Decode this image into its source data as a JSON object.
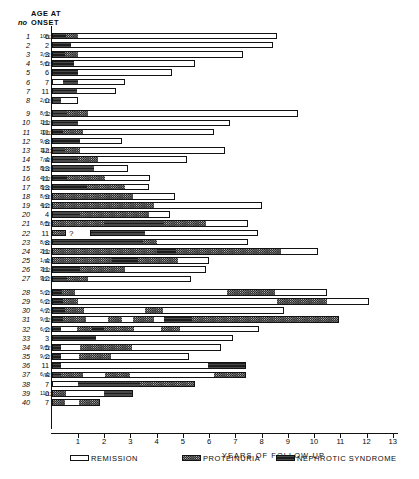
{
  "header": {
    "no_label": "no",
    "age_line1": "AGE AT",
    "age_line2": "ONSET"
  },
  "axis": {
    "title": "YEARS OF FOLLOW-UP",
    "ticks": [
      "1",
      "2",
      "3",
      "4",
      "5",
      "6",
      "7",
      "8",
      "9",
      "10",
      "11",
      "12",
      "13"
    ],
    "min": 0,
    "max": 13.2
  },
  "legend": [
    {
      "key": "remission",
      "label": "REMISSION",
      "swatch": "white"
    },
    {
      "key": "proteinuria",
      "label": "PROTEINURIA",
      "swatch": "checker"
    },
    {
      "key": "nephrotic",
      "label": "NEPHROTIC SYNDROME",
      "swatch": "dark"
    }
  ],
  "colors": {
    "remission": "#ffffff",
    "proteinuria": "#d8d8d8",
    "nephrotic": "#2e2e2e",
    "ink": "#121212"
  },
  "chart_data": {
    "type": "bar",
    "title": "",
    "xlabel": "YEARS OF FOLLOW-UP",
    "ylabel": "",
    "xlim": [
      0,
      13.2
    ],
    "grid": false,
    "legend_position": "bottom",
    "note": "Stacked horizontal timeline bars; each patient row is a sequence of disease-state segments measured in years of follow-up.",
    "categories": [
      "remission",
      "proteinuria",
      "nephrotic"
    ],
    "rows": [
      {
        "no": "1",
        "age": "6",
        "frac": "10/12",
        "segs": [
          [
            "nephrotic",
            0.55
          ],
          [
            "proteinuria",
            0.45
          ],
          [
            "remission",
            7.6
          ]
        ]
      },
      {
        "no": "2",
        "age": "2",
        "frac": "",
        "segs": [
          [
            "nephrotic",
            0.75
          ],
          [
            "remission",
            7.7
          ]
        ]
      },
      {
        "no": "3",
        "age": "3",
        "frac": "3/12",
        "segs": [
          [
            "nephrotic",
            0.5
          ],
          [
            "proteinuria",
            0.5
          ],
          [
            "remission",
            6.3
          ]
        ]
      },
      {
        "no": "4",
        "age": "6",
        "frac": "5/12",
        "segs": [
          [
            "nephrotic",
            0.85
          ],
          [
            "remission",
            4.6
          ]
        ]
      },
      {
        "no": "5",
        "age": "6",
        "frac": "",
        "segs": [
          [
            "nephrotic",
            1.0
          ],
          [
            "remission",
            3.6
          ]
        ]
      },
      {
        "no": "6",
        "age": "7",
        "frac": "",
        "segs": [
          [
            "remission",
            0.45
          ],
          [
            "nephrotic",
            0.55
          ],
          [
            "remission",
            1.8
          ]
        ]
      },
      {
        "no": "7",
        "age": "11",
        "frac": "",
        "segs": [
          [
            "nephrotic",
            0.95
          ],
          [
            "remission",
            1.5
          ]
        ]
      },
      {
        "no": "8",
        "age": "0",
        "frac": "2/12",
        "segs": [
          [
            "nephrotic",
            0.35
          ],
          [
            "remission",
            0.65
          ]
        ]
      },
      {
        "no": "9",
        "age": "1",
        "frac": "8/12",
        "segs": [
          [
            "nephrotic",
            0.6
          ],
          [
            "proteinuria",
            0.8
          ],
          [
            "remission",
            8.0
          ]
        ]
      },
      {
        "no": "10",
        "age": "11",
        "frac": "1/12",
        "segs": [
          [
            "nephrotic",
            1.0
          ],
          [
            "remission",
            5.8
          ]
        ]
      },
      {
        "no": "11",
        "age": "11",
        "frac": "10/12",
        "segs": [
          [
            "nephrotic",
            0.45
          ],
          [
            "proteinuria",
            0.75
          ],
          [
            "remission",
            5.0
          ]
        ]
      },
      {
        "no": "12",
        "age": "8",
        "frac": "9/12",
        "segs": [
          [
            "nephrotic",
            1.1
          ],
          [
            "remission",
            1.6
          ]
        ]
      },
      {
        "no": "13",
        "age": "12",
        "frac": "11/12",
        "segs": [
          [
            "nephrotic",
            0.5
          ],
          [
            "proteinuria",
            0.6
          ],
          [
            "remission",
            5.5
          ]
        ]
      },
      {
        "no": "14",
        "age": "4",
        "frac": "7/12",
        "segs": [
          [
            "nephrotic",
            1.0
          ],
          [
            "proteinuria",
            0.75
          ],
          [
            "remission",
            3.4
          ]
        ]
      },
      {
        "no": "15",
        "age": "13",
        "frac": "8/12",
        "segs": [
          [
            "nephrotic",
            1.6
          ],
          [
            "remission",
            1.3
          ]
        ]
      },
      {
        "no": "16",
        "age": "11",
        "frac": "4/12",
        "segs": [
          [
            "nephrotic",
            0.6
          ],
          [
            "proteinuria",
            1.45
          ],
          [
            "remission",
            1.7
          ]
        ]
      },
      {
        "no": "17",
        "age": "13",
        "frac": "8/12",
        "segs": [
          [
            "nephrotic",
            1.35
          ],
          [
            "proteinuria",
            1.45
          ],
          [
            "remission",
            0.9
          ]
        ]
      },
      {
        "no": "18",
        "age": "9",
        "frac": "8/12",
        "segs": [
          [
            "proteinuria",
            3.1
          ],
          [
            "remission",
            1.6
          ]
        ]
      },
      {
        "no": "19",
        "age": "12",
        "frac": "4/12",
        "segs": [
          [
            "proteinuria",
            3.9
          ],
          [
            "remission",
            4.1
          ]
        ]
      },
      {
        "no": "20",
        "age": "4",
        "frac": "",
        "segs": [
          [
            "nephrotic",
            1.1
          ],
          [
            "proteinuria",
            2.6
          ],
          [
            "remission",
            0.8
          ]
        ]
      },
      {
        "no": "21",
        "age": "5",
        "frac": "8/12",
        "segs": [
          [
            "proteinuria",
            2.0
          ],
          [
            "nephrotic",
            2.3
          ],
          [
            "proteinuria",
            1.6
          ],
          [
            "remission",
            1.6
          ]
        ]
      },
      {
        "no": "22",
        "age": "11",
        "frac": "",
        "segs": [
          [
            "proteinuria",
            0.55
          ],
          [
            "gap",
            0.9
          ],
          [
            "nephrotic",
            2.1
          ],
          [
            "remission",
            4.3
          ]
        ]
      },
      {
        "no": "23",
        "age": "8",
        "frac": "8/12",
        "segs": [
          [
            "nephrotic",
            3.5
          ],
          [
            "proteinuria",
            0.5
          ],
          [
            "remission",
            3.5
          ]
        ]
      },
      {
        "no": "24",
        "age": "11",
        "frac": "2/12",
        "segs": [
          [
            "proteinuria",
            4.0
          ],
          [
            "nephrotic",
            0.75
          ],
          [
            "proteinuria",
            4.0
          ],
          [
            "remission",
            1.4
          ]
        ]
      },
      {
        "no": "25",
        "age": "4",
        "frac": "1/12",
        "segs": [
          [
            "proteinuria",
            2.3
          ],
          [
            "nephrotic",
            1.0
          ],
          [
            "proteinuria",
            1.5
          ],
          [
            "remission",
            1.2
          ]
        ]
      },
      {
        "no": "26",
        "age": "11",
        "frac": "3/12",
        "segs": [
          [
            "nephrotic",
            1.1
          ],
          [
            "proteinuria",
            1.7
          ],
          [
            "remission",
            3.1
          ]
        ]
      },
      {
        "no": "27",
        "age": "12",
        "frac": "9/12",
        "segs": [
          [
            "nephrotic",
            0.6
          ],
          [
            "proteinuria",
            0.8
          ],
          [
            "remission",
            3.9
          ]
        ]
      },
      {
        "no": "28",
        "age": "2",
        "frac": "5/12",
        "segs": [
          [
            "nephrotic",
            0.4
          ],
          [
            "proteinuria",
            0.5
          ],
          [
            "remission",
            5.8
          ],
          [
            "proteinuria",
            1.8
          ],
          [
            "remission",
            2.0
          ]
        ]
      },
      {
        "no": "29",
        "age": "2",
        "frac": "6/12",
        "segs": [
          [
            "nephrotic",
            0.45
          ],
          [
            "proteinuria",
            0.55
          ],
          [
            "remission",
            7.6
          ],
          [
            "proteinuria",
            1.9
          ],
          [
            "remission",
            1.6
          ]
        ]
      },
      {
        "no": "30",
        "age": "7",
        "frac": "4/12",
        "segs": [
          [
            "nephrotic",
            0.5
          ],
          [
            "proteinuria",
            0.75
          ],
          [
            "remission",
            2.3
          ],
          [
            "proteinuria",
            0.7
          ],
          [
            "remission",
            4.6
          ]
        ]
      },
      {
        "no": "31",
        "age": "1",
        "frac": "9/12",
        "segs": [
          [
            "nephrotic",
            0.45
          ],
          [
            "proteinuria",
            0.85
          ],
          [
            "remission",
            0.85
          ],
          [
            "proteinuria",
            0.55
          ],
          [
            "remission",
            0.4
          ],
          [
            "proteinuria",
            0.8
          ],
          [
            "remission",
            0.4
          ],
          [
            "nephrotic",
            1.05
          ],
          [
            "proteinuria",
            5.6
          ]
        ]
      },
      {
        "no": "32",
        "age": "2",
        "frac": "6/12",
        "segs": [
          [
            "nephrotic",
            0.35
          ],
          [
            "remission",
            0.6
          ],
          [
            "proteinuria",
            0.6
          ],
          [
            "nephrotic",
            0.45
          ],
          [
            "proteinuria",
            1.15
          ],
          [
            "remission",
            1.0
          ],
          [
            "proteinuria",
            0.75
          ],
          [
            "remission",
            3.0
          ]
        ]
      },
      {
        "no": "33",
        "age": "3",
        "frac": "",
        "segs": [
          [
            "nephrotic",
            1.7
          ],
          [
            "remission",
            5.2
          ]
        ]
      },
      {
        "no": "34",
        "age": "5",
        "frac": "9/12",
        "segs": [
          [
            "nephrotic",
            0.35
          ],
          [
            "remission",
            0.75
          ],
          [
            "proteinuria",
            1.95
          ],
          [
            "remission",
            3.4
          ]
        ]
      },
      {
        "no": "35",
        "age": "2",
        "frac": "9/12",
        "segs": [
          [
            "nephrotic",
            0.35
          ],
          [
            "remission",
            0.7
          ],
          [
            "proteinuria",
            1.2
          ],
          [
            "remission",
            3.0
          ]
        ]
      },
      {
        "no": "36",
        "age": "11",
        "frac": "",
        "segs": [
          [
            "nephrotic",
            0.35
          ],
          [
            "remission",
            5.6
          ],
          [
            "nephrotic",
            1.45
          ]
        ]
      },
      {
        "no": "37",
        "age": "4",
        "frac": "6/12",
        "segs": [
          [
            "nephrotic",
            0.35
          ],
          [
            "proteinuria",
            0.85
          ],
          [
            "remission",
            0.85
          ],
          [
            "proteinuria",
            0.95
          ],
          [
            "remission",
            3.2
          ],
          [
            "proteinuria",
            1.2
          ]
        ]
      },
      {
        "no": "38",
        "age": "7",
        "frac": "",
        "segs": [
          [
            "remission",
            1.0
          ],
          [
            "nephrotic",
            2.35
          ],
          [
            "proteinuria",
            2.1
          ]
        ]
      },
      {
        "no": "39",
        "age": "0",
        "frac": "11/12",
        "segs": [
          [
            "proteinuria",
            0.55
          ],
          [
            "remission",
            1.45
          ],
          [
            "nephrotic",
            1.1
          ]
        ]
      },
      {
        "no": "40",
        "age": "7",
        "frac": "",
        "segs": [
          [
            "proteinuria",
            0.5
          ],
          [
            "remission",
            0.55
          ],
          [
            "proteinuria",
            0.8
          ]
        ]
      }
    ]
  }
}
